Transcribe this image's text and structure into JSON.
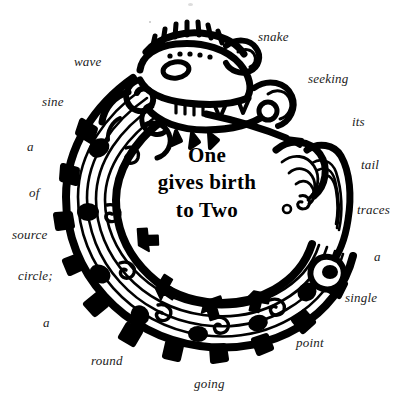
{
  "image": {
    "title": "Ouroboros feathered-serpent ring with circular caption",
    "background_color": "#ffffff",
    "ink_color": "#000000",
    "text_color": "#1b1b1b"
  },
  "center_caption": {
    "line1": "One",
    "line2": "gives birth",
    "line3": "to Two"
  },
  "ring_text": {
    "full_sentence": "snake seeking its tail traces a single point going round a circle; of a sine wave",
    "words": [
      {
        "text": "snake",
        "x": 258,
        "y": 30,
        "align": "left"
      },
      {
        "text": "wave",
        "x": 74,
        "y": 55,
        "align": "left"
      },
      {
        "text": "seeking",
        "x": 308,
        "y": 72,
        "align": "left"
      },
      {
        "text": "sine",
        "x": 42,
        "y": 95,
        "align": "left"
      },
      {
        "text": "its",
        "x": 352,
        "y": 115,
        "align": "left"
      },
      {
        "text": "a",
        "x": 27,
        "y": 140,
        "align": "left"
      },
      {
        "text": "tail",
        "x": 361,
        "y": 158,
        "align": "left"
      },
      {
        "text": "of",
        "x": 29,
        "y": 186,
        "align": "left"
      },
      {
        "text": "traces",
        "x": 357,
        "y": 203,
        "align": "left"
      },
      {
        "text": "source",
        "x": 12,
        "y": 228,
        "align": "left"
      },
      {
        "text": "a",
        "x": 374,
        "y": 250,
        "align": "left"
      },
      {
        "text": "circle;",
        "x": 18,
        "y": 269,
        "align": "left"
      },
      {
        "text": "single",
        "x": 345,
        "y": 291,
        "align": "left"
      },
      {
        "text": "a",
        "x": 43,
        "y": 316,
        "align": "left"
      },
      {
        "text": "point",
        "x": 296,
        "y": 336,
        "align": "left"
      },
      {
        "text": "round",
        "x": 91,
        "y": 354,
        "align": "left"
      },
      {
        "text": "going",
        "x": 194,
        "y": 377,
        "align": "left"
      }
    ]
  },
  "artwork": {
    "name": "feathered-serpent-ouroboros",
    "description": "Mesoamerican / Aztec style plumed serpent (Quetzalcoatl) curled into an open ring, head at upper-left biting toward its tail at the right, banded body with scroll and feather ornaments",
    "style": "black ink line art on white"
  }
}
